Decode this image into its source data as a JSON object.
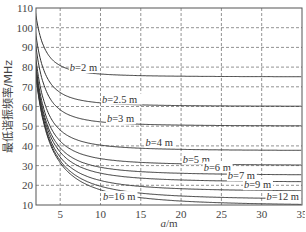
{
  "chart_data": {
    "type": "line",
    "title": "",
    "xlabel": "a/m",
    "ylabel": "最低谐振频率/MHz",
    "xlim": [
      2,
      35
    ],
    "ylim": [
      10,
      110
    ],
    "xticks": [
      5,
      10,
      15,
      20,
      25,
      30,
      35
    ],
    "yticks": [
      10,
      20,
      30,
      40,
      50,
      60,
      70,
      80,
      90,
      100,
      110
    ],
    "grid": true,
    "grid_style": "dashed",
    "formula_note": "f = 150*sqrt(1/a^2 + 1/b^2) MHz",
    "series": [
      {
        "name": "b=2 m",
        "b": 2,
        "label_pos": {
          "x": 6.2,
          "y": 78
        },
        "values_at": {
          "a2": 106.1,
          "a5": 80.8,
          "a10": 76.5,
          "a20": 75.4,
          "a35": 75.1
        }
      },
      {
        "name": "b=2.5 m",
        "b": 2.5,
        "label_pos": {
          "x": 10.2,
          "y": 62
        },
        "values_at": {
          "a2": 96.0,
          "a5": 67.1,
          "a10": 61.8,
          "a20": 60.5,
          "a35": 60.1
        }
      },
      {
        "name": "b=3 m",
        "b": 3,
        "label_pos": {
          "x": 10.8,
          "y": 52
        },
        "values_at": {
          "a2": 90.1,
          "a5": 58.3,
          "a10": 52.2,
          "a20": 50.6,
          "a35": 50.2
        }
      },
      {
        "name": "b=4 m",
        "b": 4,
        "label_pos": {
          "x": 15.6,
          "y": 40
        },
        "values_at": {
          "a2": 83.9,
          "a5": 48.0,
          "a10": 40.4,
          "a20": 38.2,
          "a35": 37.7
        }
      },
      {
        "name": "b=5 m",
        "b": 5,
        "label_pos": {
          "x": 20.2,
          "y": 31.5
        },
        "values_at": {
          "a2": 80.8,
          "a5": 42.4,
          "a10": 33.5,
          "a20": 30.9,
          "a35": 30.3
        }
      },
      {
        "name": "b=6 m",
        "b": 6,
        "label_pos": {
          "x": 22.8,
          "y": 27.5
        },
        "values_at": {
          "a2": 79.1,
          "a5": 39.1,
          "a10": 29.2,
          "a20": 26.1,
          "a35": 25.4
        }
      },
      {
        "name": "b=7 m",
        "b": 7,
        "label_pos": {
          "x": 25.8,
          "y": 23
        },
        "values_at": {
          "a2": 78.0,
          "a5": 36.9,
          "a10": 26.2,
          "a20": 22.7,
          "a35": 21.9
        }
      },
      {
        "name": "b=9 m",
        "b": 9,
        "label_pos": {
          "x": 27.8,
          "y": 18.5
        },
        "values_at": {
          "a2": 76.8,
          "a5": 34.3,
          "a10": 22.4,
          "a20": 18.3,
          "a35": 17.2
        }
      },
      {
        "name": "b=12 m",
        "b": 12,
        "label_pos": {
          "x": 30.6,
          "y": 12.5
        },
        "values_at": {
          "a2": 76.0,
          "a5": 32.5,
          "a10": 19.5,
          "a20": 14.6,
          "a35": 13.2
        }
      },
      {
        "name": "b=16 m",
        "b": 16,
        "label_pos": {
          "x": 10.3,
          "y": 12.5
        },
        "values_at": {
          "a2": 75.6,
          "a5": 31.4,
          "a10": 17.7,
          "a20": 12.0,
          "a35": 10.3
        }
      }
    ]
  }
}
